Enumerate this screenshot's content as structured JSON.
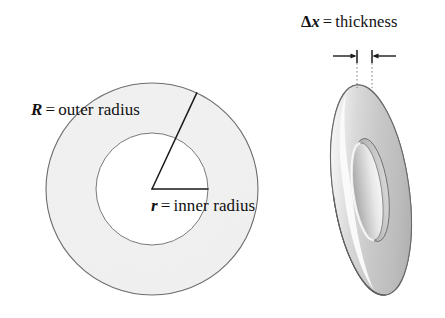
{
  "figure": {
    "background_color": "#ffffff",
    "width": 445,
    "height": 318
  },
  "labels": {
    "outer_radius": {
      "symbol": "R",
      "equals": "=",
      "text": "outer radius",
      "full": "R = outer radius"
    },
    "inner_radius": {
      "symbol": "r",
      "equals": "=",
      "text": "inner radius",
      "full": "r = inner radius"
    },
    "thickness": {
      "delta": "Δ",
      "symbol": "x",
      "equals": "=",
      "text": "thickness",
      "full": "Δx = thickness"
    }
  },
  "face_view": {
    "name": "flat annulus face view",
    "center_x": 152,
    "center_y": 189,
    "outer_radius_px": 106,
    "inner_radius_px": 56,
    "fill_color": "#e2e2e2",
    "stroke_color": "#6d6d6d",
    "hole_color": "#ffffff",
    "radius_line_angle_deg": 65,
    "radius_line_color": "#1a1a1a"
  },
  "perspective_view": {
    "name": "tilted 3D washer view",
    "center_x": 371,
    "center_y": 190,
    "outer_rx": 38,
    "outer_ry": 106,
    "inner_rx": 17,
    "inner_ry": 52,
    "tilt_deg": -8,
    "face_light": "#f2f2f2",
    "face_mid": "#d6d6d6",
    "face_dark": "#a8a8a8",
    "stroke_color": "#6a6a6a"
  },
  "dimension": {
    "name": "thickness dimension",
    "left_tick_x": 357,
    "right_tick_x": 372,
    "tick_top_y": 50,
    "tick_bottom_y": 62,
    "arrow_y": 56,
    "leader_bottom_y": 88,
    "leader_style": "dotted",
    "color": "#1a1a1a"
  }
}
